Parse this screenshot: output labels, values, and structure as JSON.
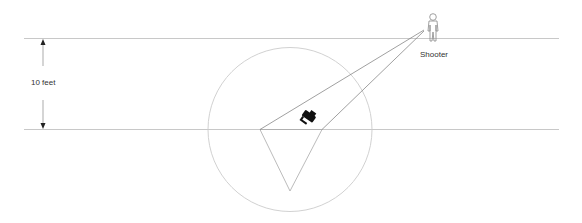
{
  "diagram": {
    "dimension_label": "10 feet",
    "shooter_label": "Shooter",
    "colors": {
      "background": "#ffffff",
      "boundary_line": "#c8c8c8",
      "circle": "#c8c8c8",
      "sight_lines": "#777777",
      "triangle": "#aaaaaa",
      "arrow": "#555555",
      "camera_icon": "#111111",
      "figure": "#888888"
    },
    "icons": {
      "camera": "camera-icon",
      "shooter": "person-icon",
      "dimension_arrow": "double-arrow-icon"
    }
  }
}
